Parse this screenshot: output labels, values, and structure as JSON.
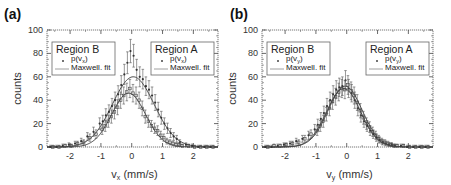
{
  "chart_data": [
    {
      "panel_label": "(a)",
      "type": "scatter",
      "xlabel": "v",
      "xlabel_sub": "x",
      "xlabel_unit": " (mm/s)",
      "ylabel": "counts",
      "xlim": [
        -2.75,
        2.8
      ],
      "ylim": [
        0,
        100
      ],
      "xticks": [
        -2,
        -1,
        0,
        1,
        2
      ],
      "yticks": [
        0,
        20,
        40,
        60,
        80,
        100
      ],
      "grid": false,
      "legends": [
        {
          "title": "Region B",
          "marker_label": "p(v",
          "marker_sub": "x",
          "marker_close": ")",
          "line_label": "Maxwell. fit",
          "position": "upper-left"
        },
        {
          "title": "Region A",
          "marker_label": "p(v",
          "marker_sub": "x",
          "marker_close": ")",
          "line_label": "Maxwell. fit",
          "position": "upper-right"
        }
      ],
      "series": [
        {
          "name": "Region A",
          "fit": {
            "amplitude": 60,
            "center": 0.05,
            "sigma": 0.68
          },
          "x": [
            -2.6,
            -2.4,
            -2.2,
            -2.0,
            -1.8,
            -1.6,
            -1.4,
            -1.2,
            -1.0,
            -0.9,
            -0.8,
            -0.7,
            -0.6,
            -0.5,
            -0.4,
            -0.3,
            -0.2,
            -0.1,
            0.0,
            0.1,
            0.2,
            0.3,
            0.4,
            0.5,
            0.6,
            0.7,
            0.8,
            0.9,
            1.0,
            1.1,
            1.2,
            1.3,
            1.4,
            1.5,
            1.6,
            1.8,
            2.0,
            2.2,
            2.4,
            2.6
          ],
          "y": [
            0,
            0,
            1,
            2,
            3,
            5,
            9,
            13,
            20,
            22,
            27,
            30,
            35,
            40,
            45,
            53,
            62,
            72,
            82,
            78,
            66,
            60,
            58,
            52,
            49,
            44,
            38,
            32,
            25,
            20,
            16,
            12,
            9,
            7,
            4,
            2,
            1,
            0,
            0,
            0
          ]
        },
        {
          "name": "Region B",
          "fit": {
            "amplitude": 46,
            "center": -0.1,
            "sigma": 0.55
          },
          "x": [
            -2.6,
            -2.4,
            -2.2,
            -2.0,
            -1.8,
            -1.6,
            -1.4,
            -1.2,
            -1.0,
            -0.9,
            -0.8,
            -0.7,
            -0.6,
            -0.5,
            -0.4,
            -0.3,
            -0.2,
            -0.1,
            0.0,
            0.1,
            0.2,
            0.3,
            0.4,
            0.5,
            0.6,
            0.7,
            0.8,
            0.9,
            1.0,
            1.1,
            1.2,
            1.3,
            1.4,
            1.5,
            1.6,
            1.8,
            2.0,
            2.2,
            2.4,
            2.6
          ],
          "y": [
            0,
            0,
            1,
            1,
            3,
            4,
            8,
            11,
            15,
            18,
            22,
            26,
            30,
            34,
            40,
            44,
            47,
            50,
            46,
            44,
            40,
            33,
            26,
            22,
            18,
            16,
            14,
            10,
            8,
            5,
            4,
            3,
            2,
            2,
            1,
            1,
            0,
            0,
            0,
            0
          ]
        }
      ]
    },
    {
      "panel_label": "(b)",
      "type": "scatter",
      "xlabel": "v",
      "xlabel_sub": "y",
      "xlabel_unit": " (mm/s)",
      "ylabel": "counts",
      "xlim": [
        -2.75,
        2.8
      ],
      "ylim": [
        0,
        100
      ],
      "xticks": [
        -2,
        -1,
        0,
        1,
        2
      ],
      "yticks": [
        0,
        20,
        40,
        60,
        80,
        100
      ],
      "grid": false,
      "legends": [
        {
          "title": "Region B",
          "marker_label": "p(v",
          "marker_sub": "y",
          "marker_close": ")",
          "line_label": "Maxwell. fit",
          "position": "upper-left"
        },
        {
          "title": "Region A",
          "marker_label": "p(v",
          "marker_sub": "y",
          "marker_close": ")",
          "line_label": "Maxwell. fit",
          "position": "upper-right"
        }
      ],
      "series": [
        {
          "name": "Region A",
          "fit": {
            "amplitude": 52,
            "center": -0.05,
            "sigma": 0.55
          },
          "x": [
            -2.6,
            -2.4,
            -2.2,
            -2.0,
            -1.8,
            -1.6,
            -1.4,
            -1.2,
            -1.0,
            -0.9,
            -0.8,
            -0.7,
            -0.6,
            -0.5,
            -0.4,
            -0.3,
            -0.2,
            -0.1,
            0.0,
            0.1,
            0.2,
            0.3,
            0.4,
            0.5,
            0.6,
            0.7,
            0.8,
            0.9,
            1.0,
            1.1,
            1.2,
            1.3,
            1.4,
            1.5,
            1.6,
            1.8,
            2.0,
            2.2,
            2.4,
            2.6
          ],
          "y": [
            0,
            0,
            1,
            2,
            3,
            5,
            7,
            10,
            15,
            19,
            24,
            29,
            35,
            40,
            45,
            49,
            51,
            52,
            57,
            50,
            46,
            40,
            33,
            27,
            22,
            18,
            14,
            11,
            8,
            6,
            4,
            3,
            2,
            2,
            1,
            1,
            0,
            0,
            0,
            0
          ]
        },
        {
          "name": "Region B",
          "fit": {
            "amplitude": 50,
            "center": -0.1,
            "sigma": 0.55
          },
          "x": [
            -2.6,
            -2.4,
            -2.2,
            -2.0,
            -1.8,
            -1.6,
            -1.4,
            -1.2,
            -1.0,
            -0.9,
            -0.8,
            -0.7,
            -0.6,
            -0.5,
            -0.4,
            -0.3,
            -0.2,
            -0.1,
            0.0,
            0.1,
            0.2,
            0.3,
            0.4,
            0.5,
            0.6,
            0.7,
            0.8,
            0.9,
            1.0,
            1.1,
            1.2,
            1.3,
            1.4,
            1.5,
            1.6,
            1.8,
            2.0,
            2.2,
            2.4,
            2.6
          ],
          "y": [
            0,
            1,
            1,
            2,
            3,
            4,
            7,
            11,
            14,
            18,
            22,
            28,
            33,
            39,
            43,
            47,
            50,
            49,
            53,
            48,
            44,
            38,
            31,
            25,
            20,
            17,
            13,
            10,
            7,
            5,
            4,
            3,
            2,
            1,
            1,
            1,
            0,
            0,
            0,
            0
          ]
        }
      ]
    }
  ]
}
